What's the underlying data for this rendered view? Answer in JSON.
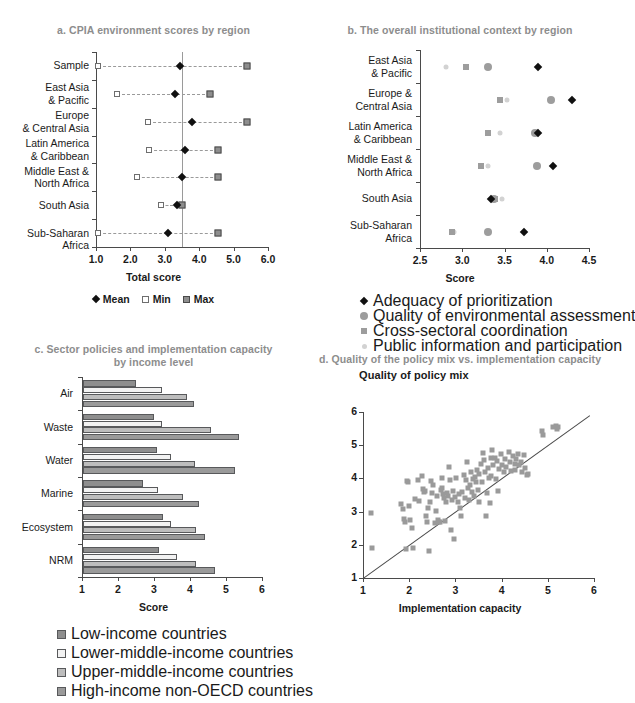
{
  "figure": {
    "width": 613,
    "height": 703
  },
  "panels": {
    "a": {
      "key": "a",
      "title": "a. CPIA environment scores by region",
      "xlabel": "Total score",
      "legend": [
        {
          "label": "Mean",
          "marker": "diamond"
        },
        {
          "label": "Min",
          "marker": "open-square"
        },
        {
          "label": "Max",
          "marker": "filled-square"
        }
      ]
    },
    "b": {
      "key": "b",
      "title": "b. The overall institutional context by region",
      "xlabel": "Score",
      "legend": [
        {
          "label": "Adequacy of prioritization",
          "marker": "diamond"
        },
        {
          "label": "Quality of environmental assessment",
          "marker": "circle"
        },
        {
          "label": "Cross-sectoral coordination",
          "marker": "square"
        },
        {
          "label": "Public information and participation",
          "marker": "light-circle"
        }
      ]
    },
    "c": {
      "key": "c",
      "title_line1": "c. Sector policies and implementation capacity",
      "title_line2": "by income level",
      "xlabel": "Score",
      "legend": [
        {
          "label": "Low-income countries",
          "color": "#8e8e8e"
        },
        {
          "label": "Lower-middle-income countries",
          "color": "#f2f2f2"
        },
        {
          "label": "Upper-middle-income countries",
          "color": "#bdbdbd"
        },
        {
          "label": "High-income non-OECD countries",
          "color": "#9a9a9a"
        }
      ]
    },
    "d": {
      "key": "d",
      "title": "d. Quality of the policy mix vs. implementation capacity",
      "ylabel": "Quality of policy mix",
      "xlabel": "Implementation capacity"
    }
  },
  "chart_data": [
    {
      "panel": "a",
      "type": "scatter",
      "title": "a. CPIA environment scores by region",
      "xlabel": "Total score",
      "ylabel": "",
      "xlim": [
        1.0,
        6.0
      ],
      "xticks": [
        1.0,
        2.0,
        3.0,
        4.0,
        5.0,
        6.0
      ],
      "xticklabels": [
        "1.0",
        "2.0",
        "3.0",
        "4.0",
        "5.0",
        "6.0"
      ],
      "grid": false,
      "reference_line": {
        "orientation": "vertical",
        "value": 3.5
      },
      "legend_position": "below",
      "categories": [
        "Sample",
        "East Asia & Pacific",
        "Europe & Central Asia",
        "Latin America & Caribbean",
        "Middle East & North Africa",
        "South Asia",
        "Sub-Saharan Africa"
      ],
      "series": [
        {
          "name": "Mean",
          "values": [
            3.45,
            3.3,
            3.8,
            3.6,
            3.5,
            3.35,
            3.1
          ]
        },
        {
          "name": "Min",
          "values": [
            1.05,
            1.6,
            2.5,
            2.55,
            2.2,
            2.9,
            1.05
          ]
        },
        {
          "name": "Max",
          "values": [
            5.4,
            4.3,
            5.4,
            4.55,
            4.55,
            3.5,
            4.55
          ]
        }
      ]
    },
    {
      "panel": "b",
      "type": "scatter",
      "title": "b. The overall institutional context by region",
      "xlabel": "Score",
      "ylabel": "",
      "xlim": [
        2.5,
        4.5
      ],
      "xticks": [
        2.5,
        3.0,
        3.5,
        4.0,
        4.5
      ],
      "xticklabels": [
        "2.5",
        "3.0",
        "3.5",
        "4.0",
        "4.5"
      ],
      "grid": false,
      "legend_position": "below",
      "categories": [
        "East Asia & Pacific",
        "Europe & Central Asia",
        "Latin America & Caribbean",
        "Middle East & North Africa",
        "South Asia",
        "Sub-Saharan Africa"
      ],
      "series": [
        {
          "name": "Adequacy of prioritization",
          "values": [
            3.9,
            4.3,
            3.9,
            4.07,
            3.34,
            3.73
          ]
        },
        {
          "name": "Quality of environmental assessment",
          "values": [
            3.31,
            4.05,
            3.86,
            3.88,
            3.38,
            3.3
          ]
        },
        {
          "name": "Cross-sectoral coordination",
          "values": [
            3.05,
            3.45,
            3.31,
            3.22,
            3.39,
            2.88
          ]
        },
        {
          "name": "Public information and participation",
          "values": [
            2.81,
            3.53,
            3.45,
            3.3,
            3.47,
            2.9
          ]
        }
      ]
    },
    {
      "panel": "c",
      "type": "bar",
      "orientation": "horizontal",
      "title": "c. Sector policies and implementation capacity by income level",
      "xlabel": "Score",
      "ylabel": "",
      "xlim": [
        1,
        6
      ],
      "xticks": [
        1,
        2,
        3,
        4,
        5,
        6
      ],
      "xticklabels": [
        "1",
        "2",
        "3",
        "4",
        "5",
        "6"
      ],
      "grid": false,
      "legend_position": "below",
      "categories": [
        "Air",
        "Waste",
        "Water",
        "Marine",
        "Ecosystem",
        "NRM"
      ],
      "series": [
        {
          "name": "Low-income countries",
          "values": [
            2.48,
            2.97,
            3.05,
            2.68,
            3.22,
            3.1
          ]
        },
        {
          "name": "Lower-middle-income countries",
          "values": [
            3.2,
            3.2,
            3.45,
            3.07,
            3.45,
            3.6
          ]
        },
        {
          "name": "Upper-middle-income countries",
          "values": [
            3.9,
            4.55,
            4.1,
            3.78,
            4.15,
            4.15
          ]
        },
        {
          "name": "High-income non-OECD countries",
          "values": [
            4.08,
            5.32,
            5.22,
            4.22,
            4.4,
            4.68
          ]
        }
      ]
    },
    {
      "panel": "d",
      "type": "scatter",
      "title": "d. Quality of the policy mix vs. implementation capacity",
      "xlabel": "Implementation capacity",
      "ylabel": "Quality of policy mix",
      "xlim": [
        1,
        6
      ],
      "ylim": [
        1,
        6
      ],
      "xticks": [
        1,
        2,
        3,
        4,
        5,
        6
      ],
      "yticks": [
        1,
        2,
        3,
        4,
        5,
        6
      ],
      "xticklabels": [
        "1",
        "2",
        "3",
        "4",
        "5",
        "6"
      ],
      "yticklabels": [
        "1",
        "2",
        "3",
        "4",
        "5",
        "6"
      ],
      "grid": false,
      "legend_position": "none",
      "reference_line": {
        "type": "identity",
        "from": [
          1,
          1
        ],
        "to": [
          5.9,
          5.9
        ]
      },
      "points": [
        [
          1.18,
          2.96
        ],
        [
          1.2,
          1.91
        ],
        [
          1.83,
          3.23
        ],
        [
          1.86,
          3.08
        ],
        [
          1.88,
          2.77
        ],
        [
          1.9,
          2.7
        ],
        [
          1.92,
          1.86
        ],
        [
          1.95,
          3.93
        ],
        [
          1.97,
          3.88
        ],
        [
          2.0,
          3.17
        ],
        [
          2.02,
          2.74
        ],
        [
          2.05,
          2.51
        ],
        [
          2.08,
          1.9
        ],
        [
          2.12,
          3.38
        ],
        [
          2.18,
          3.95
        ],
        [
          2.22,
          3.33
        ],
        [
          2.27,
          4.08
        ],
        [
          2.3,
          3.68
        ],
        [
          2.32,
          3.58
        ],
        [
          2.35,
          3.63
        ],
        [
          2.36,
          2.88
        ],
        [
          2.38,
          2.7
        ],
        [
          2.4,
          3.12
        ],
        [
          2.42,
          1.8
        ],
        [
          2.45,
          3.28
        ],
        [
          2.48,
          3.93
        ],
        [
          2.5,
          3.56
        ],
        [
          2.52,
          3.8
        ],
        [
          2.55,
          2.65
        ],
        [
          2.58,
          3.02
        ],
        [
          2.6,
          3.47
        ],
        [
          2.62,
          2.75
        ],
        [
          2.65,
          2.7
        ],
        [
          2.66,
          2.68
        ],
        [
          2.68,
          3.65
        ],
        [
          2.7,
          3.72
        ],
        [
          2.72,
          4.02
        ],
        [
          2.74,
          3.52
        ],
        [
          2.76,
          3.4
        ],
        [
          2.78,
          2.72
        ],
        [
          2.8,
          3.3
        ],
        [
          2.82,
          3.55
        ],
        [
          2.85,
          3.48
        ],
        [
          2.86,
          4.33
        ],
        [
          2.88,
          3.96
        ],
        [
          2.9,
          2.46
        ],
        [
          2.92,
          3.36
        ],
        [
          2.95,
          3.63
        ],
        [
          2.97,
          2.18
        ],
        [
          3.0,
          3.45
        ],
        [
          3.02,
          4.0
        ],
        [
          3.05,
          3.3
        ],
        [
          3.08,
          3.52
        ],
        [
          3.1,
          3.1
        ],
        [
          3.12,
          2.86
        ],
        [
          3.15,
          3.6
        ],
        [
          3.18,
          4.1
        ],
        [
          3.2,
          3.42
        ],
        [
          3.22,
          3.95
        ],
        [
          3.25,
          4.48
        ],
        [
          3.28,
          3.7
        ],
        [
          3.3,
          3.35
        ],
        [
          3.32,
          3.8
        ],
        [
          3.34,
          4.2
        ],
        [
          3.36,
          3.58
        ],
        [
          3.38,
          3.98
        ],
        [
          3.4,
          3.46
        ],
        [
          3.42,
          4.05
        ],
        [
          3.44,
          3.88
        ],
        [
          3.46,
          4.25
        ],
        [
          3.48,
          3.65
        ],
        [
          3.5,
          4.12
        ],
        [
          3.52,
          3.3
        ],
        [
          3.55,
          4.42
        ],
        [
          3.58,
          3.9
        ],
        [
          3.6,
          4.78
        ],
        [
          3.62,
          4.55
        ],
        [
          3.64,
          4.18
        ],
        [
          3.66,
          2.88
        ],
        [
          3.68,
          3.55
        ],
        [
          3.7,
          4.3
        ],
        [
          3.72,
          4.0
        ],
        [
          3.74,
          3.26
        ],
        [
          3.76,
          4.6
        ],
        [
          3.78,
          4.08
        ],
        [
          3.8,
          4.86
        ],
        [
          3.82,
          4.4
        ],
        [
          3.85,
          4.62
        ],
        [
          3.88,
          3.98
        ],
        [
          3.9,
          4.52
        ],
        [
          3.92,
          3.62
        ],
        [
          3.95,
          4.28
        ],
        [
          3.98,
          4.72
        ],
        [
          4.0,
          4.4
        ],
        [
          4.05,
          4.18
        ],
        [
          4.08,
          4.58
        ],
        [
          4.1,
          4.34
        ],
        [
          4.15,
          4.8
        ],
        [
          4.18,
          4.48
        ],
        [
          4.2,
          4.22
        ],
        [
          4.25,
          4.66
        ],
        [
          4.28,
          4.42
        ],
        [
          4.3,
          4.26
        ],
        [
          4.32,
          4.58
        ],
        [
          4.35,
          4.74
        ],
        [
          4.38,
          4.4
        ],
        [
          4.42,
          4.5
        ],
        [
          4.45,
          4.18
        ],
        [
          4.48,
          4.7
        ],
        [
          4.5,
          4.3
        ],
        [
          4.55,
          4.1
        ],
        [
          4.58,
          4.12
        ],
        [
          4.88,
          5.42
        ],
        [
          4.9,
          5.32
        ],
        [
          5.12,
          5.56
        ],
        [
          5.18,
          5.58
        ],
        [
          5.2,
          5.5
        ],
        [
          5.22,
          5.56
        ]
      ]
    }
  ]
}
